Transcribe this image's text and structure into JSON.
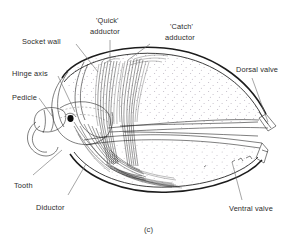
{
  "figure": {
    "caption": "(c)",
    "background_color": "#ffffff",
    "ink_color": "#1c1c1c",
    "leader_color": "#6f6f6f",
    "stipple_color": "#b9b3bd"
  },
  "labels": {
    "socket_wall": "Socket wall",
    "hinge_axis": "Hinge axis",
    "pedicle": "Pedicle",
    "tooth": "Tooth",
    "diductor": "Diductor",
    "quick_adductor_line1": "'Quick'",
    "quick_adductor_line2": "adductor",
    "catch_adductor_line1": "'Catch'",
    "catch_adductor_line2": "adductor",
    "dorsal_valve": "Dorsal valve",
    "ventral_valve": "Ventral valve"
  }
}
